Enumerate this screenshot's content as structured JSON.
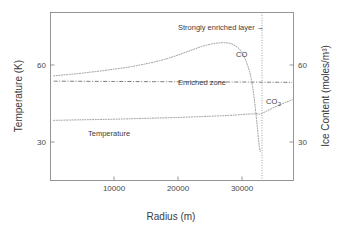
{
  "figure": {
    "background_color": "#ffffff",
    "line_color": "#8d8d8d",
    "frame_color": "#8a8a8a"
  },
  "chart_data": {
    "type": "line",
    "title": "",
    "xlabel": "Radius (m)",
    "ylabel": "Temperature (K)",
    "y2label": "Ice Content (moles/m³)",
    "xlim": [
      0,
      38000
    ],
    "ylim": [
      18,
      75
    ],
    "y2lim": [
      18,
      75
    ],
    "xticks": [
      10000,
      20000,
      30000
    ],
    "xticklabels": [
      "10000",
      "20000",
      "30000"
    ],
    "yticks": [
      30,
      60
    ],
    "yticklabels": [
      "30",
      "60"
    ],
    "y2ticks": [
      30,
      60
    ],
    "y2ticklabels": [
      "30",
      "60"
    ],
    "grid": false,
    "legend": "inline-labels",
    "series": [
      {
        "name": "CO",
        "label": "CO",
        "axis": "right",
        "style": "dotted",
        "x": [
          500,
          2000,
          4000,
          6000,
          8000,
          10000,
          12000,
          14000,
          16000,
          18000,
          20000,
          22000,
          24000,
          26000,
          27500,
          28500,
          29500,
          30200,
          30800,
          31400,
          31900,
          32300,
          32600,
          32800
        ],
        "y": [
          53.5,
          53.8,
          54.2,
          54.7,
          55.2,
          55.8,
          56.4,
          57.2,
          58.1,
          59.2,
          60.6,
          62.2,
          63.7,
          64.6,
          64.7,
          64.2,
          62.7,
          60.4,
          57.2,
          52.5,
          45.0,
          37.0,
          30.5,
          27.8
        ]
      },
      {
        "name": "CO2",
        "label": "CO₂",
        "axis": "right",
        "style": "dotted",
        "x": [
          500,
          5000,
          10000,
          15000,
          20000,
          25000,
          28000,
          30000,
          31500,
          32400,
          32800,
          33400,
          34500,
          35800,
          37000,
          37800
        ],
        "y": [
          38.4,
          38.6,
          38.8,
          39.1,
          39.4,
          39.8,
          40.1,
          40.4,
          40.6,
          40.6,
          40.5,
          41.1,
          42.3,
          43.6,
          44.7,
          45.4
        ]
      },
      {
        "name": "Enriched zone level",
        "label": "Enriched zone",
        "axis": "right",
        "style": "dashdot",
        "x": [
          500,
          10000,
          20000,
          30000,
          37800
        ],
        "y": [
          51.7,
          51.6,
          51.5,
          51.4,
          51.3
        ]
      }
    ],
    "annotations": [
      {
        "name": "strongly-enriched-layer",
        "text": "Strongly enriched layer →",
        "x_px": 178,
        "y_px": 30
      },
      {
        "name": "co-label",
        "text": "CO",
        "x_px": 236,
        "y_px": 57
      },
      {
        "name": "enriched-zone-label",
        "text": "Enriched zone",
        "x_px": 178,
        "y_px": 85
      },
      {
        "name": "co2-label",
        "text": "CO",
        "subscript": "2",
        "x_px": 266,
        "y_px": 104
      },
      {
        "name": "temperature-label",
        "text": "Temperature",
        "x_px": 88,
        "y_px": 136
      }
    ],
    "marker_lines": [
      {
        "name": "strongly-enriched-layer-line",
        "orientation": "vertical",
        "x": 32800,
        "style": "dotted"
      }
    ]
  }
}
